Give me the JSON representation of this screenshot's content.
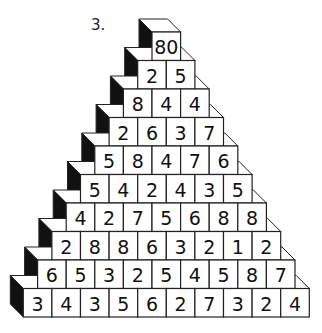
{
  "problem": {
    "number_label": "3."
  },
  "pyramid": {
    "rows": [
      [
        "80"
      ],
      [
        "2",
        "5"
      ],
      [
        "8",
        "4",
        "4"
      ],
      [
        "2",
        "6",
        "3",
        "7"
      ],
      [
        "5",
        "8",
        "4",
        "7",
        "6"
      ],
      [
        "5",
        "4",
        "2",
        "4",
        "3",
        "5"
      ],
      [
        "4",
        "2",
        "7",
        "5",
        "6",
        "8",
        "8"
      ],
      [
        "2",
        "8",
        "8",
        "6",
        "3",
        "2",
        "1",
        "2"
      ],
      [
        "6",
        "5",
        "3",
        "2",
        "5",
        "4",
        "5",
        "8",
        "7"
      ],
      [
        "3",
        "4",
        "3",
        "5",
        "6",
        "2",
        "7",
        "3",
        "2",
        "4"
      ]
    ],
    "colors": {
      "face": "#ffffff",
      "side": "#111111",
      "stroke": "#222222"
    }
  }
}
